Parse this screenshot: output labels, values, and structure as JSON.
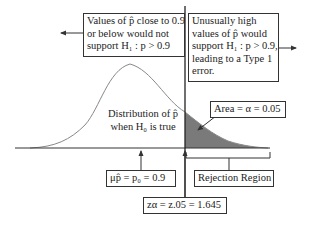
{
  "diagram": {
    "type": "hypothesis-test-right-tail",
    "left_box": {
      "lines": [
        "Values of p̂ close to 0.9",
        "or below would not",
        "support H₁ : p > 0.9"
      ]
    },
    "right_box": {
      "lines": [
        "Unusually high",
        "values of p̂ would",
        "support H₁ : p > 0.9,",
        "leading to a Type 1",
        "error."
      ]
    },
    "curve_label": {
      "lines": [
        "Distribution of p̂",
        "when H₀ is true"
      ]
    },
    "area_box": {
      "text": "Area = α = 0.05"
    },
    "mean_box": {
      "text": "μp̂ = p₀ = 0.9"
    },
    "critical_box": {
      "text": "zα = z.05 = 1.645"
    },
    "rejection_box": {
      "text": "Rejection Region"
    },
    "colors": {
      "line": "#333333",
      "curve": "#888888",
      "shaded_area": "#7a7a7a",
      "background": "#ffffff"
    },
    "arrows": [
      "left-arrow",
      "right-arrow",
      "mean-up-arrow",
      "critical-up-arrow",
      "area-pointer-arrow"
    ]
  }
}
